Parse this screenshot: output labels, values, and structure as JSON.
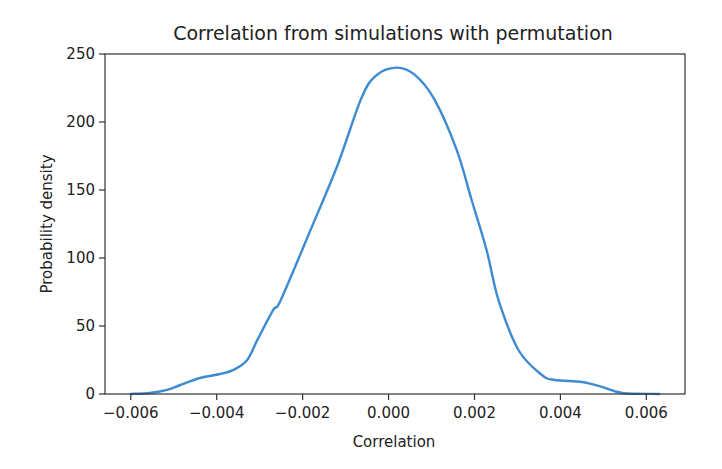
{
  "chart_data": {
    "type": "line",
    "title": "Correlation from simulations with permutation",
    "xlabel": "Correlation",
    "ylabel": "Probability density",
    "xlim": [
      -0.0066,
      0.0069
    ],
    "ylim": [
      0,
      250
    ],
    "x_ticks": [
      -0.006,
      -0.004,
      -0.002,
      0.0,
      0.002,
      0.004,
      0.006
    ],
    "x_tick_labels": [
      "−0.006",
      "−0.004",
      "−0.002",
      "0.000",
      "0.002",
      "0.004",
      "0.006"
    ],
    "y_ticks": [
      0,
      50,
      100,
      150,
      200,
      250
    ],
    "y_tick_labels": [
      "0",
      "50",
      "100",
      "150",
      "200",
      "250"
    ],
    "grid": false,
    "legend": null,
    "series": [
      {
        "name": "KDE of simulated correlation",
        "color": "#3d8bd0",
        "x": [
          -0.006,
          -0.00556,
          -0.00516,
          -0.00485,
          -0.00439,
          -0.00392,
          -0.00361,
          -0.00329,
          -0.00305,
          -0.00268,
          -0.00251,
          -0.00181,
          -0.00118,
          -0.00064,
          -0.0003,
          0.00018,
          0.0006,
          0.00106,
          0.00158,
          0.00193,
          0.00228,
          0.00256,
          0.00303,
          0.00357,
          0.00387,
          0.0045,
          0.00497,
          0.00544,
          0.0063
        ],
        "y": [
          0,
          0.7,
          3,
          6.6,
          11.8,
          14.7,
          17.7,
          25,
          40,
          62,
          69,
          121,
          169,
          217,
          234,
          240,
          235,
          217,
          180,
          143,
          106,
          69,
          32,
          14,
          10.3,
          8.8,
          5.2,
          0.7,
          0
        ]
      }
    ]
  },
  "colors": {
    "line": "#3d8bd0",
    "axis": "#333333",
    "text": "#222222",
    "background": "#ffffff"
  }
}
